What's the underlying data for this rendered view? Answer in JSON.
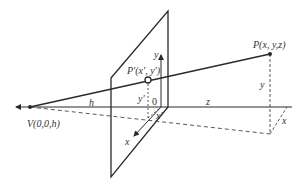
{
  "diagram": {
    "labels": {
      "viewpoint": "V(0,0,h)",
      "point": "P(x, y,z)",
      "projected_point": "P'(x', y')",
      "h": "h",
      "z": "z",
      "y_axis": "y",
      "x_axis": "x",
      "origin": "0",
      "y_prime": "y'",
      "x_prime": "x'",
      "y_point": "y",
      "x_point": "x"
    },
    "colors": {
      "line": "#2a2a2a",
      "dashed": "#444444",
      "text": "#333333",
      "background": "#ffffff"
    }
  }
}
